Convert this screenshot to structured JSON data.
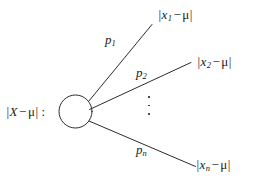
{
  "diagram": {
    "type": "probability-fan-diagram",
    "stroke_color": "#2b2b2b",
    "background_color": "#ffffff",
    "source": {
      "label_prefix": "|",
      "label_var": "X",
      "label_minus": "−",
      "label_mu": "μ",
      "label_suffix": "|",
      "label_colon": ":",
      "node_shape": "circle"
    },
    "edges": [
      {
        "name": "edge-1",
        "label_var": "p",
        "label_sub": "1"
      },
      {
        "name": "edge-2",
        "label_var": "p",
        "label_sub": "2"
      },
      {
        "name": "edge-n",
        "label_var": "p",
        "label_sub": "n"
      }
    ],
    "leaves": [
      {
        "name": "leaf-1",
        "bar": "|",
        "var": "x",
        "sub": "1",
        "op": "−",
        "mu": "μ",
        "bar_end": "|"
      },
      {
        "name": "leaf-2",
        "bar": "|",
        "var": "x",
        "sub": "2",
        "op": "−",
        "mu": "μ",
        "bar_end": "|"
      },
      {
        "name": "leaf-n",
        "bar": "|",
        "var": "x",
        "sub": "n",
        "op": "−",
        "mu": "μ",
        "bar_end": "|"
      }
    ],
    "ellipsis": {
      "orientation": "vertical",
      "dot_count": 3
    }
  }
}
